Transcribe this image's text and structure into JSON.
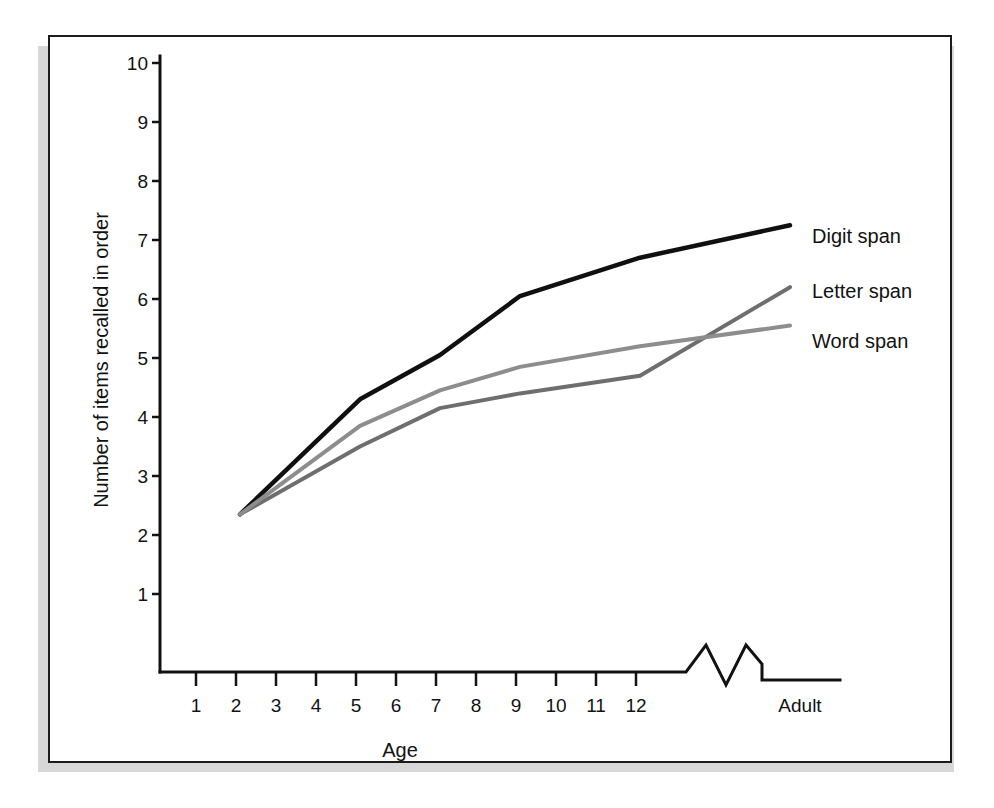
{
  "figure": {
    "background_color": "#ffffff",
    "frame_color": "#1b1b1b",
    "shadow_color": "#d7d7d7"
  },
  "chart_data": {
    "type": "line",
    "title": "",
    "xlabel": "Age",
    "ylabel": "Number of items recalled in order",
    "x_tick_labels": [
      "1",
      "2",
      "3",
      "4",
      "5",
      "6",
      "7",
      "8",
      "9",
      "10",
      "11",
      "12",
      "Adult"
    ],
    "y_tick_labels": [
      "1",
      "2",
      "3",
      "4",
      "5",
      "6",
      "7",
      "8",
      "9",
      "10"
    ],
    "ylim": [
      0,
      10
    ],
    "grid": false,
    "legend_position": "right-inline",
    "axis_break": {
      "present": true,
      "shape": "zigzag",
      "between": [
        "12",
        "Adult"
      ],
      "note": "axis break between age 12 and Adult"
    },
    "x": [
      2,
      5,
      7,
      9,
      12,
      15
    ],
    "x_display": [
      "2",
      "5",
      "7",
      "9",
      "12",
      "Adult"
    ],
    "series": [
      {
        "name": "Digit span",
        "color": "#101010",
        "stroke_width": 4.5,
        "values": [
          2.35,
          4.3,
          5.05,
          6.05,
          6.7,
          7.25
        ]
      },
      {
        "name": "Letter span",
        "color": "#6e6e6e",
        "stroke_width": 4.0,
        "values": [
          2.35,
          3.5,
          4.15,
          4.4,
          4.7,
          6.2
        ]
      },
      {
        "name": "Word span",
        "color": "#8d8d8d",
        "stroke_width": 4.0,
        "values": [
          2.35,
          3.85,
          4.45,
          4.85,
          5.2,
          5.55
        ]
      }
    ],
    "annotations": [
      {
        "text": "Digit span",
        "series": "Digit span"
      },
      {
        "text": "Letter span",
        "series": "Letter span"
      },
      {
        "text": "Word span",
        "series": "Word span"
      }
    ]
  }
}
